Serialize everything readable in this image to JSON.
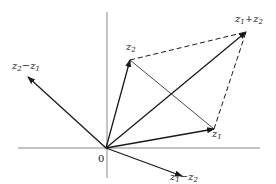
{
  "diagram": {
    "origin": {
      "label": "0",
      "x": 106,
      "y": 148
    },
    "axes": {
      "horizontal": {
        "x1": 18,
        "x2": 260,
        "y": 148
      },
      "vertical": {
        "x": 107,
        "y1": 12,
        "y2": 178
      },
      "color": "#888888"
    },
    "vectors": [
      {
        "id": "z1",
        "base": "z",
        "sub": "1",
        "op": "",
        "base2": "",
        "sub2": "",
        "tip": [
          214,
          129
        ],
        "label_pos": [
          212,
          141
        ]
      },
      {
        "id": "z2",
        "base": "z",
        "sub": "2",
        "op": "",
        "base2": "",
        "sub2": "",
        "tip": [
          130,
          60
        ],
        "label_pos": [
          126,
          54
        ]
      },
      {
        "id": "z1_plus_z2",
        "base": "z",
        "sub": "1",
        "op": "+",
        "base2": "z",
        "sub2": "2",
        "tip": [
          246,
          32
        ],
        "label_pos": [
          235,
          26
        ]
      },
      {
        "id": "z2_minus_z1",
        "base": "z",
        "sub": "2",
        "op": "−",
        "base2": "z",
        "sub2": "1",
        "tip": [
          28,
          77
        ],
        "label_pos": [
          12,
          73
        ]
      },
      {
        "id": "z1_minus_z2",
        "base": "z",
        "sub": "1",
        "op": "−",
        "base2": "z",
        "sub2": "2",
        "tip": [
          182,
          176
        ],
        "label_pos": [
          170,
          184
        ]
      }
    ],
    "dashed_lines": [
      {
        "from": [
          130,
          60
        ],
        "to": [
          246,
          32
        ]
      },
      {
        "from": [
          214,
          129
        ],
        "to": [
          246,
          32
        ]
      }
    ],
    "thin_lines": [
      {
        "from": [
          130,
          60
        ],
        "to": [
          214,
          129
        ],
        "note": "z1 - z2 connecting segment"
      }
    ],
    "colors": {
      "stroke": "#1a1a1a",
      "axis": "#888888",
      "background": "#ffffff"
    }
  }
}
